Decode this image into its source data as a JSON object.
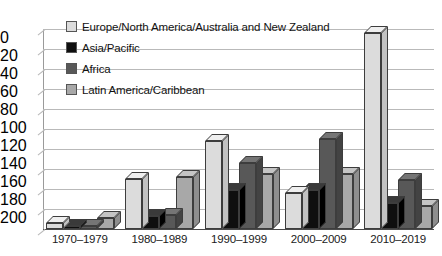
{
  "chart_data": {
    "type": "bar",
    "title": "",
    "subtitle": "",
    "xlabel": "",
    "ylabel": "",
    "categories": [
      "1970–1979",
      "1980–1989",
      "1990–1999",
      "2000–2009",
      "2010–2019"
    ],
    "series": [
      {
        "name": "Europe/North America/Australia and New Zealand",
        "color": "#dcdcdc",
        "values": [
          6,
          50,
          88,
          36,
          196
        ]
      },
      {
        "name": "Asia/Pacific",
        "color": "#0f0f0f",
        "values": [
          3,
          13,
          39,
          39,
          26
        ]
      },
      {
        "name": "Africa",
        "color": "#585858",
        "values": [
          3,
          14,
          66,
          90,
          49
        ]
      },
      {
        "name": "Latin America/Caribbean",
        "color": "#a8a8a8",
        "values": [
          11,
          52,
          55,
          55,
          23
        ]
      }
    ],
    "ylim": [
      0,
      200
    ],
    "y_ticks": [
      0,
      20,
      40,
      60,
      80,
      100,
      120,
      140,
      160,
      180,
      200
    ],
    "y_tick_labels": [
      "0",
      "20",
      "40",
      "60",
      "80",
      "100",
      "120",
      "140",
      "160",
      "180",
      "200"
    ],
    "grid": true,
    "legend_position": "upper-left-inside",
    "style": "3d-grouped-columns"
  },
  "legend": {
    "items": [
      {
        "label": "Europe/North America/Australia and New Zealand",
        "color": "#dcdcdc"
      },
      {
        "label": "Asia/Pacific",
        "color": "#0f0f0f"
      },
      {
        "label": "Africa",
        "color": "#585858"
      },
      {
        "label": "Latin America/Caribbean",
        "color": "#a8a8a8"
      }
    ]
  }
}
